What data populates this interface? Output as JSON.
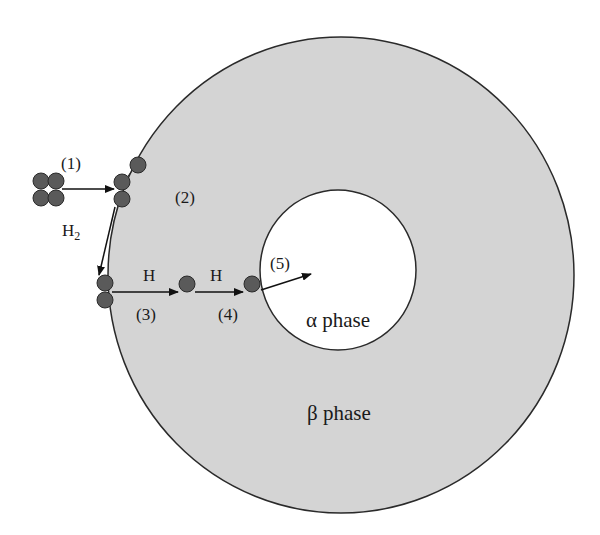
{
  "diagram": {
    "colors": {
      "background": "#ffffff",
      "beta_fill": "#d4d4d4",
      "alpha_fill": "#ffffff",
      "outline": "#2a2a2a",
      "atom_fill": "#5a5a5a",
      "atom_stroke": "#2a2a2a",
      "arrow": "#111111"
    },
    "regions": {
      "beta": {
        "label": "β phase"
      },
      "alpha": {
        "label": "α phase"
      }
    },
    "labels": {
      "step1": "(1)",
      "step2": "(2)",
      "step3": "(3)",
      "step4": "(4)",
      "step5": "(5)",
      "h2": "H",
      "h2_sub": "2",
      "h_a": "H",
      "h_b": "H"
    },
    "steps": [
      {
        "id": "1",
        "label": "(1)",
        "description": "H2 molecules approach surface"
      },
      {
        "id": "2",
        "label": "(2)",
        "description": "Adsorption at surface"
      },
      {
        "id": "3",
        "label": "(3)",
        "description": "Dissociation into H"
      },
      {
        "id": "4",
        "label": "(4)",
        "description": "H diffusion through β phase"
      },
      {
        "id": "5",
        "label": "(5)",
        "description": "Transfer into α phase"
      }
    ]
  }
}
